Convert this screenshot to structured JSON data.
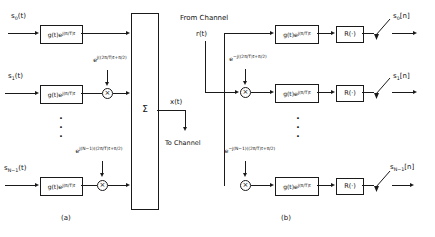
{
  "diagram": {
    "tx": {
      "inputs": [
        "s<sub>0</sub>(t)",
        "s<sub>1</sub>(t)",
        "s<sub>N−1</sub>(t)"
      ],
      "filter_block_label": "g(t)e<sup>j(π/T)t</sup>",
      "carrier_exponents": [
        "e<sup>j((2π/T)t+π/2)</sup>",
        "e<sup>j(N−1)((2π/T)t+π/2)</sup>"
      ],
      "multiplier_symbol": "×",
      "summer_symbol": "Σ",
      "sum_output_label": "x(t)",
      "to_channel_label": "To Channel",
      "ellipsis": "·\n·\n·",
      "caption": "(a)"
    },
    "rx": {
      "from_channel_label": "From Channel",
      "input_label": "r(t)",
      "carrier_exponents": [
        "e<sup>−j((2π/T)t+π/2)</sup>",
        "e<sup>−j(N−1)((2π/T)t+π/2)</sup>"
      ],
      "filter_block_label": "g(t)e<sup>j(π/T)t</sup>",
      "real_part_label": "R(·)",
      "multiplier_symbol": "×",
      "outputs": [
        "s<sub>0</sub>[n]",
        "s<sub>1</sub>[n]",
        "s<sub>N−1</sub>[n]"
      ],
      "ellipsis": "·\n·\n·",
      "caption": "(b)"
    },
    "colors": {
      "line": "#1a1a1a",
      "background": "#ffffff"
    }
  }
}
